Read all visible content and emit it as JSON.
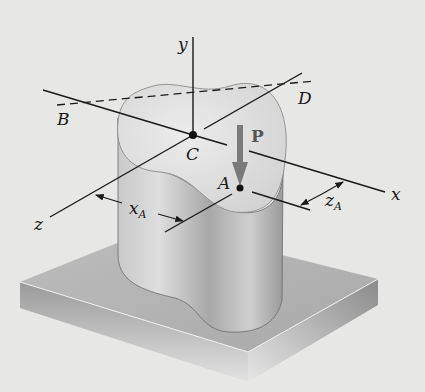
{
  "figure": {
    "colors": {
      "background": "#e7e7e5",
      "line": "#1a1a1a",
      "load_arrow": "#777777",
      "column_top": "#dcdcdc",
      "column_side": "#bcbcbc",
      "plate_top": "#b5b5b5",
      "plate_side": "#8f8f8f"
    },
    "labels": {
      "y_axis": "y",
      "x_axis": "x",
      "z_axis": "z",
      "point_B": "B",
      "point_D": "D",
      "point_C": "C",
      "point_A": "A",
      "load": "P",
      "dim_xA_main": "x",
      "dim_xA_sub": "A",
      "dim_zA_main": "z",
      "dim_zA_sub": "A"
    },
    "elements": {
      "axes": [
        "x",
        "y",
        "z"
      ],
      "neutral_axis_line": "B–D (dashed)",
      "load_point": "A",
      "centroid": "C"
    }
  }
}
